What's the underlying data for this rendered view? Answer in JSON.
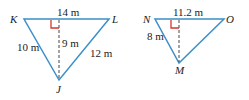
{
  "colors": {
    "triangle_stroke": "#3d8fc9",
    "altitude": "#444444",
    "right_angle": "#d9352f",
    "text": "#222222"
  },
  "triangles": [
    {
      "id": "KLJ",
      "vertices": {
        "K": {
          "label": "K",
          "x": 24,
          "y": 19
        },
        "L": {
          "label": "L",
          "x": 109,
          "y": 19
        },
        "J": {
          "label": "J",
          "x": 59,
          "y": 80
        }
      },
      "foot": {
        "x": 59,
        "y": 19
      },
      "sides": {
        "KL": "14 m",
        "KJ": "10 m",
        "LJ": "12 m"
      },
      "altitude": "9 m"
    },
    {
      "id": "NOM",
      "vertices": {
        "N": {
          "label": "N",
          "x": 155,
          "y": 19
        },
        "O": {
          "label": "O",
          "x": 224,
          "y": 19
        },
        "M": {
          "label": "M",
          "x": 179,
          "y": 63
        }
      },
      "foot": {
        "x": 179,
        "y": 19
      },
      "sides": {
        "NO": "11.2 m",
        "NM": "8 m"
      }
    }
  ]
}
